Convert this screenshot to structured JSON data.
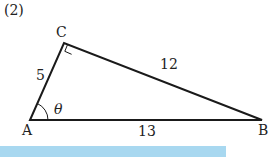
{
  "problem_number": "(2)",
  "vertices": {
    "A": {
      "label": "A",
      "x": 30,
      "y": 120
    },
    "B": {
      "label": "B",
      "x": 262,
      "y": 120
    },
    "C": {
      "label": "C",
      "x": 64,
      "y": 43
    }
  },
  "sides": {
    "AC": "5",
    "CB": "12",
    "AB": "13"
  },
  "angle_label": "θ",
  "colors": {
    "line": "#1a1a1a",
    "bar": "#a8d8f0"
  }
}
